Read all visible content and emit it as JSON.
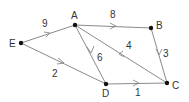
{
  "diagram": {
    "type": "weighted directed graph",
    "nodes": [
      {
        "id": "A",
        "label": "A",
        "x": 75,
        "y": 25
      },
      {
        "id": "B",
        "label": "B",
        "x": 151,
        "y": 28
      },
      {
        "id": "C",
        "label": "C",
        "x": 167,
        "y": 83
      },
      {
        "id": "D",
        "label": "D",
        "x": 106,
        "y": 84
      },
      {
        "id": "E",
        "label": "E",
        "x": 21,
        "y": 43
      }
    ],
    "edges": [
      {
        "from": "E",
        "to": "A",
        "weight": "9"
      },
      {
        "from": "A",
        "to": "B",
        "weight": "8"
      },
      {
        "from": "E",
        "to": "D",
        "weight": "2"
      },
      {
        "from": "A",
        "to": "D",
        "weight": "6"
      },
      {
        "from": "C",
        "to": "A",
        "weight": "4"
      },
      {
        "from": "B",
        "to": "C",
        "weight": "3"
      },
      {
        "from": "D",
        "to": "C",
        "weight": "1"
      }
    ],
    "colors": {
      "edge": "#8a8a8a",
      "node": "#111111",
      "text": "#333333"
    }
  }
}
